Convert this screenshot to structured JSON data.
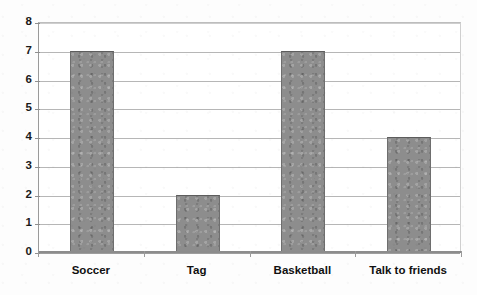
{
  "chart_data": {
    "type": "bar",
    "title": "",
    "subtitle": "",
    "xlabel": "",
    "ylabel": "",
    "categories": [
      "Soccer",
      "Tag",
      "Basketball",
      "Talk to friends"
    ],
    "values": [
      7,
      2,
      7,
      4
    ],
    "series": [
      {
        "name": "Count",
        "values": [
          7,
          2,
          7,
          4
        ]
      }
    ],
    "ylim": [
      0,
      8
    ],
    "ytick_step": 1,
    "ytick_labels": [
      "0",
      "1",
      "2",
      "3",
      "4",
      "5",
      "6",
      "7",
      "8"
    ],
    "grid": true,
    "grid_axis": "y",
    "legend": false,
    "legend_position": "none",
    "annotations": [],
    "colors": {
      "bar_fill": "#8d8d8d",
      "bar_border": "#6e6e6e",
      "gridline": "#a9a9a9",
      "axis": "#8c8c8c",
      "text": "#101010",
      "background": "#fdfdfd",
      "plot_background": "#ffffff"
    }
  }
}
